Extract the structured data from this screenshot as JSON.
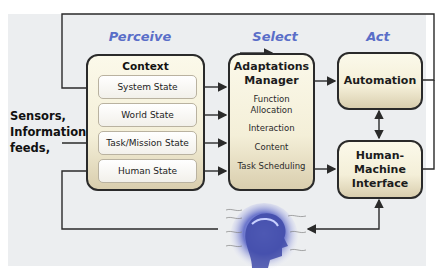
{
  "diagram": {
    "phases": [
      {
        "id": "perceive",
        "label": "Perceive"
      },
      {
        "id": "select",
        "label": "Select"
      },
      {
        "id": "act",
        "label": "Act"
      }
    ],
    "input": {
      "label_lines": [
        "Sensors,",
        "Information",
        "feeds,"
      ]
    },
    "context_assessment": {
      "title": "Context Assessment",
      "items": [
        "System State",
        "World State",
        "Task/Mission State",
        "Human State"
      ]
    },
    "adaptations_manager": {
      "title_lines": [
        "Adaptations",
        "Manager"
      ],
      "items": [
        "Function Allocation",
        "Interaction",
        "Content",
        "Task Scheduling"
      ]
    },
    "automation": {
      "label": "Automation"
    },
    "hmi": {
      "label_lines": [
        "Human-",
        "Machine",
        "Interface"
      ]
    },
    "human_operator": {
      "icon": "human-head-brainwave-icon"
    },
    "colors": {
      "phase_label": "#5a6ec8",
      "panel_fill_top": "#fbf9ea",
      "panel_fill_bottom": "#d9ceae",
      "background": "#eceef0",
      "line": "#2a2a2a"
    }
  }
}
